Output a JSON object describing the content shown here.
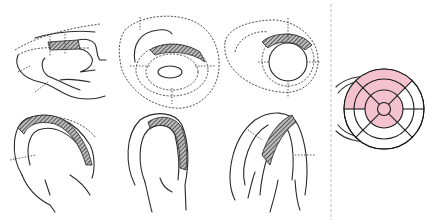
{
  "figure": {
    "panels": [
      {
        "id": "parasternal-long-axis",
        "row": 1,
        "col": 1
      },
      {
        "id": "short-axis-mitral",
        "row": 1,
        "col": 2
      },
      {
        "id": "short-axis-papillary",
        "row": 1,
        "col": 3
      },
      {
        "id": "apical-four-chamber",
        "row": 2,
        "col": 1
      },
      {
        "id": "apical-two-chamber",
        "row": 2,
        "col": 2
      },
      {
        "id": "apical-long-axis",
        "row": 2,
        "col": 3
      }
    ],
    "bullseye": {
      "colors": {
        "affected": "#f4c2cf",
        "normal": "#ffffff",
        "line": "#1a1a1a"
      },
      "rings": [
        {
          "name": "basal",
          "segments": 6,
          "affected": [
            1,
            2
          ]
        },
        {
          "name": "mid",
          "segments": 6,
          "affected": [
            1,
            2
          ]
        },
        {
          "name": "apical",
          "segments": 4,
          "affected": [
            1,
            2,
            3,
            4
          ]
        },
        {
          "name": "apex",
          "segments": 1,
          "affected": [
            1
          ]
        }
      ]
    },
    "divider": {
      "style": "dashed",
      "color": "#bbbbbb"
    }
  }
}
